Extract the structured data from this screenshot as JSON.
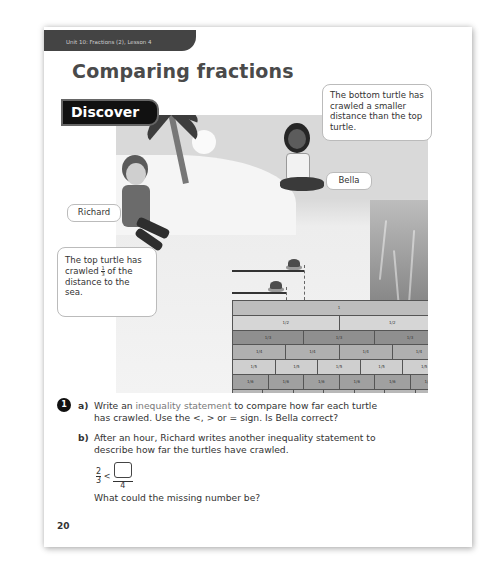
{
  "header": {
    "unit_tab": "Unit 10: Fractions (2), Lesson 4",
    "title": "Comparing fractions",
    "section_badge": "Discover"
  },
  "scene": {
    "characters": [
      {
        "name": "Richard",
        "speech": "The top turtle has crawled 1/3 of the distance to the sea.",
        "speech_parts": {
          "before": "The top turtle has crawled ",
          "fraction_num": "1",
          "fraction_den": "3",
          "after": " of the distance to the sea."
        }
      },
      {
        "name": "Bella",
        "speech": "The bottom turtle has crawled a smaller distance than the top turtle."
      }
    ],
    "icons": [
      "palm-tree-icon",
      "sun-icon",
      "turtle-icon",
      "turtle-icon",
      "sea-icon"
    ]
  },
  "fraction_wall": {
    "rows": [
      {
        "denominator": 1,
        "label": "1"
      },
      {
        "denominator": 2,
        "label": "1/2"
      },
      {
        "denominator": 3,
        "label": "1/3"
      },
      {
        "denominator": 4,
        "label": "1/4"
      },
      {
        "denominator": 5,
        "label": "1/5"
      },
      {
        "denominator": 6,
        "label": "1/6"
      },
      {
        "denominator": 7,
        "label": "1/7"
      },
      {
        "denominator": 8,
        "label": "1/8"
      },
      {
        "denominator": 9,
        "label": "1/9"
      },
      {
        "denominator": 10,
        "label": "1/10"
      },
      {
        "denominator": 11,
        "label": "1/11"
      },
      {
        "denominator": 12,
        "label": "1/12"
      }
    ],
    "row_colors": [
      "#bdbdbd",
      "#d6d6d6",
      "#8f8f8f",
      "#b0b0b0",
      "#cfcfcf",
      "#a0a0a0",
      "#b8b8b8",
      "#c2c2c2",
      "#8a8a8a",
      "#979797",
      "#dcdcdc",
      "#a8a8a8"
    ]
  },
  "questions": {
    "number": "1",
    "a": {
      "label": "a)",
      "line1_before": "Write an ",
      "line1_highlight": "inequality statement",
      "line1_after": " to compare how far each turtle",
      "line2": "has crawled. Use the <, > or = sign. Is Bella correct?"
    },
    "b": {
      "label": "b)",
      "line1": "After an hour, Richard writes another inequality statement to",
      "line2": "describe how far the turtles have crawled.",
      "expression": {
        "left_num": "2",
        "left_den": "3",
        "sign": "<",
        "right_num": "",
        "right_den": "4"
      },
      "prompt": "What could the missing number be?"
    }
  },
  "page_number": "20"
}
